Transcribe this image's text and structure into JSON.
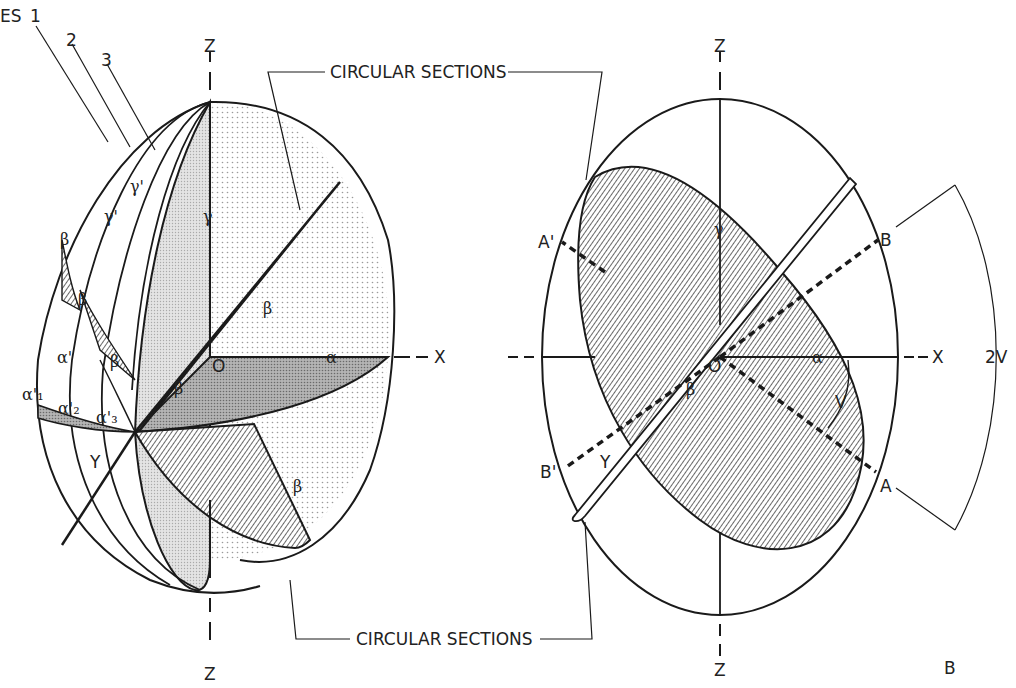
{
  "figure": {
    "panel_letter_right": "B"
  },
  "left_panel": {
    "top_left_fragment": "ES",
    "numbers": [
      "1",
      "2",
      "3"
    ],
    "axis_labels": {
      "z_top": "Z",
      "z_bottom": "Z",
      "x": "X",
      "y": "Y",
      "origin": "O"
    },
    "greek_labels": {
      "gamma_axis": "γ",
      "gamma_prime_1": "γ'",
      "gamma_prime_2": "γ'",
      "alpha": "α",
      "alpha_prime": "α'",
      "alpha_prime_1": "α'₁",
      "alpha_prime_2": "α'₂",
      "alpha_prime_3": "α'₃",
      "beta": "β"
    },
    "callout_top": "CIRCULAR SECTIONS",
    "callout_bottom": "CIRCULAR SECTIONS"
  },
  "right_panel": {
    "axis_labels": {
      "z_top": "Z",
      "z_bottom": "Z",
      "x": "X",
      "y": "Y",
      "origin": "O"
    },
    "greek_labels": {
      "gamma": "γ",
      "alpha": "α",
      "beta": "β"
    },
    "points": {
      "a": "A",
      "a_prime": "A'",
      "b": "B",
      "b_prime": "B'"
    },
    "angle_labels": {
      "v": "V",
      "two_v": "2V"
    }
  },
  "colors": {
    "ink": "#1a1a1a",
    "stipple": "#c8c8c8",
    "shaded": "#9a9a9a",
    "hatch": "#555555",
    "background": "#ffffff"
  }
}
